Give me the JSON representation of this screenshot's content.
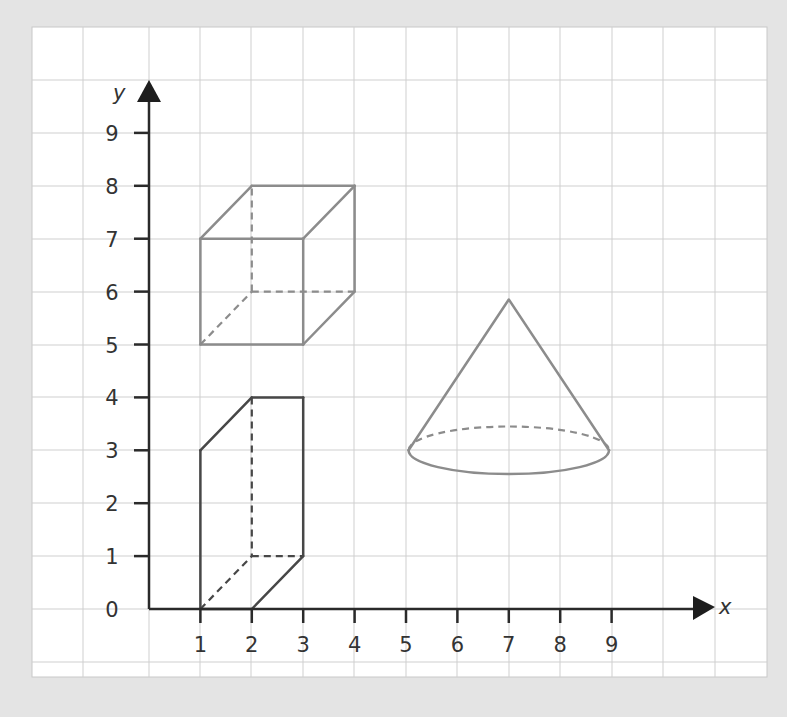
{
  "figure": {
    "axes": {
      "x_label": "x",
      "y_label": "y",
      "x_ticks": [
        "1",
        "2",
        "3",
        "4",
        "5",
        "6",
        "7",
        "8",
        "9"
      ],
      "y_ticks": [
        "0",
        "1",
        "2",
        "3",
        "4",
        "5",
        "6",
        "7",
        "8",
        "9"
      ]
    },
    "shapes": [
      {
        "name": "cube",
        "color": "#8c8c8c",
        "solid_edges": [
          [
            [
              1,
              5
            ],
            [
              3,
              5
            ]
          ],
          [
            [
              3,
              5
            ],
            [
              3,
              7
            ]
          ],
          [
            [
              3,
              7
            ],
            [
              1,
              7
            ]
          ],
          [
            [
              1,
              7
            ],
            [
              1,
              5
            ]
          ],
          [
            [
              1,
              7
            ],
            [
              2,
              8
            ]
          ],
          [
            [
              2,
              8
            ],
            [
              4,
              8
            ]
          ],
          [
            [
              4,
              8
            ],
            [
              3,
              7
            ]
          ],
          [
            [
              4,
              8
            ],
            [
              4,
              6
            ]
          ],
          [
            [
              4,
              6
            ],
            [
              3,
              5
            ]
          ]
        ],
        "hidden_edges": [
          [
            [
              2,
              6
            ],
            [
              2,
              8
            ]
          ],
          [
            [
              2,
              6
            ],
            [
              4,
              6
            ]
          ],
          [
            [
              1,
              5
            ],
            [
              2,
              6
            ]
          ]
        ]
      },
      {
        "name": "prism",
        "color": "#474747",
        "solid_edges": [
          [
            [
              1,
              0
            ],
            [
              1,
              3
            ]
          ],
          [
            [
              1,
              3
            ],
            [
              2,
              4
            ]
          ],
          [
            [
              2,
              4
            ],
            [
              3,
              4
            ]
          ],
          [
            [
              3,
              4
            ],
            [
              3,
              1
            ]
          ],
          [
            [
              3,
              1
            ],
            [
              2,
              0
            ]
          ],
          [
            [
              2,
              0
            ],
            [
              1,
              0
            ]
          ]
        ],
        "hidden_edges": [
          [
            [
              2,
              4
            ],
            [
              2,
              1
            ]
          ],
          [
            [
              2,
              1
            ],
            [
              3,
              1
            ]
          ],
          [
            [
              1,
              0
            ],
            [
              2,
              1
            ]
          ]
        ]
      },
      {
        "name": "cone",
        "color": "#8c8c8c",
        "apex": [
          7,
          5.85
        ],
        "base_center": [
          7,
          3
        ],
        "base_rx": 1.95,
        "base_ry": 0.45
      }
    ],
    "colors": {
      "background": "#e4e4e4",
      "panel": "#ffffff",
      "grid": "#cfcfcf",
      "axis": "#2a2a2a"
    }
  }
}
